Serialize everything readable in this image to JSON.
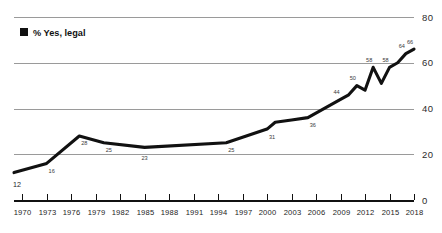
{
  "legend": {
    "marker": "filled-square",
    "label": "% Yes, legal",
    "color": "#111111"
  },
  "axis": {
    "y_ticks": [
      "0",
      "20",
      "40",
      "60",
      "80"
    ],
    "x_ticks": [
      "1970",
      "1973",
      "1976",
      "1979",
      "1982",
      "1985",
      "1988",
      "1991",
      "1994",
      "1997",
      "2000",
      "2003",
      "2006",
      "2009",
      "2012",
      "2015",
      "2018"
    ]
  },
  "chart_data": {
    "type": "line",
    "title": "",
    "subtitle": "",
    "xlabel": "",
    "ylabel": "",
    "xlim": [
      1969,
      2018
    ],
    "ylim": [
      0,
      80
    ],
    "grid": true,
    "gridlines": [
      20,
      40,
      60,
      80
    ],
    "legend_position": "top-left",
    "series": [
      {
        "name": "% Yes, legal",
        "color": "#111111",
        "x": [
          1969,
          1972,
          1973,
          1977,
          1980,
          1985,
          1995,
          2000,
          2001,
          2003,
          2005,
          2009,
          2010,
          2011,
          2012,
          2013,
          2014,
          2015,
          2016,
          2017,
          2018
        ],
        "values": [
          12,
          15,
          16,
          28,
          25,
          23,
          25,
          31,
          34,
          35,
          36,
          44,
          46,
          50,
          48,
          58,
          51,
          58,
          60,
          64,
          66
        ]
      }
    ],
    "point_labels": [
      {
        "x": 1969,
        "value": 12,
        "text": "12"
      },
      {
        "x": 1973,
        "value": 16,
        "text": "16"
      },
      {
        "x": 1977,
        "value": 28,
        "text": "28"
      },
      {
        "x": 1980,
        "value": 25,
        "text": "25"
      },
      {
        "x": 1985,
        "value": 23,
        "text": "23"
      },
      {
        "x": 1995,
        "value": 25,
        "text": "25"
      },
      {
        "x": 2000,
        "value": 31,
        "text": "31"
      },
      {
        "x": 2005,
        "value": 36,
        "text": "36"
      },
      {
        "x": 2009,
        "value": 44,
        "text": "44"
      },
      {
        "x": 2011,
        "value": 50,
        "text": "50"
      },
      {
        "x": 2013,
        "value": 58,
        "text": "58"
      },
      {
        "x": 2015,
        "value": 58,
        "text": "58"
      },
      {
        "x": 2017,
        "value": 64,
        "text": "64"
      },
      {
        "x": 2018,
        "value": 66,
        "text": "66"
      }
    ]
  }
}
